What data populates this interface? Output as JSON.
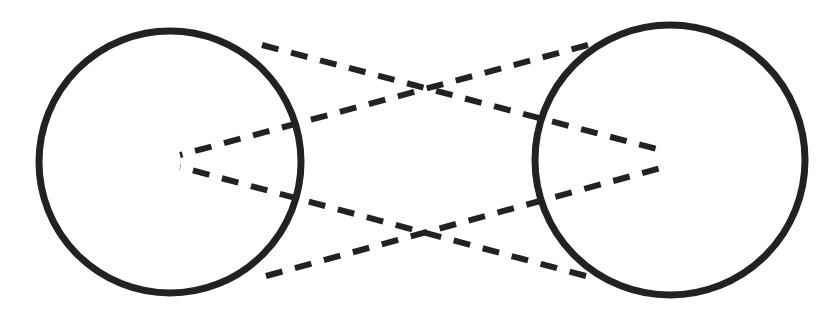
{
  "figure": {
    "title": "Two circles joined by crossing dashed lines",
    "background_color": "#ffffff",
    "width": 840,
    "height": 322,
    "ink_color": "#222222",
    "style": "hand-drawn line diagram"
  },
  "shapes": {
    "left_circle": {
      "name": "left circle",
      "cx": 170,
      "cy": 162,
      "r": 131,
      "stroke_width": 7,
      "stroke_color": "#222222",
      "fill": "none"
    },
    "right_circle": {
      "name": "right circle",
      "cx": 670,
      "cy": 160,
      "r": 135,
      "stroke_width": 7,
      "stroke_color": "#222222",
      "fill": "none"
    }
  },
  "dashed_lines": {
    "stroke_color": "#222222",
    "stroke_width": 6,
    "dash_pattern": "17 13",
    "segments": [
      {
        "name": "upper-left-to-right-vertex",
        "from": [
          262,
          45
        ],
        "to": [
          668,
          152
        ],
        "note": "starts on upper right of left circle, runs down-right to right vertex"
      },
      {
        "name": "upper-right-to-left-vertex",
        "from": [
          588,
          45
        ],
        "to": [
          180,
          155
        ],
        "note": "starts on upper left of right circle, runs down-left to left vertex"
      },
      {
        "name": "lower-left-to-right-vertex",
        "from": [
          266,
          276
        ],
        "to": [
          668,
          166
        ],
        "note": "starts on lower right of left circle, runs up-right to right vertex"
      },
      {
        "name": "lower-right-to-left-vertex",
        "from": [
          586,
          276
        ],
        "to": [
          180,
          167
        ],
        "note": "starts on lower left of right circle, runs up-left to left vertex"
      }
    ],
    "vertices": {
      "left_vertex": [
        178,
        161
      ],
      "right_vertex": [
        668,
        159
      ]
    },
    "crossings": [
      {
        "name": "upper-crossing",
        "at": [
          420,
          92
        ]
      },
      {
        "name": "lower-crossing",
        "at": [
          420,
          228
        ]
      }
    ]
  }
}
